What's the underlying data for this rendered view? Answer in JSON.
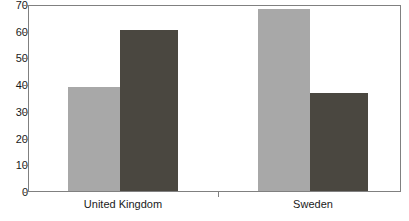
{
  "chart_data": {
    "type": "bar",
    "title": "",
    "subtitle": "",
    "xlabel": "",
    "ylabel": "",
    "categories": [
      "United Kingdom",
      "Sweden"
    ],
    "series": [
      {
        "name": "series-1",
        "color": "#a8a8a8",
        "values": [
          39.5,
          69
        ]
      },
      {
        "name": "series-2",
        "color": "#4a4740",
        "values": [
          61,
          37
        ]
      }
    ],
    "ylim": [
      0,
      70
    ],
    "yticks": [
      0,
      10,
      20,
      30,
      40,
      50,
      60,
      70
    ],
    "ytick_labels": [
      "0",
      "10",
      "20",
      "30",
      "40",
      "50",
      "60",
      "70"
    ],
    "grid": false,
    "legend": "none",
    "annotations": []
  },
  "axes": {
    "y_labels": [
      "70",
      "60",
      "50",
      "40",
      "30",
      "20",
      "10",
      "0"
    ]
  },
  "bars": {
    "uk_light_label": "United Kingdom light bar",
    "uk_dark_label": "United Kingdom dark bar",
    "sweden_light_label": "Sweden light bar",
    "sweden_dark_label": "Sweden dark bar"
  },
  "categories": {
    "first": "United Kingdom",
    "second": "Sweden"
  }
}
